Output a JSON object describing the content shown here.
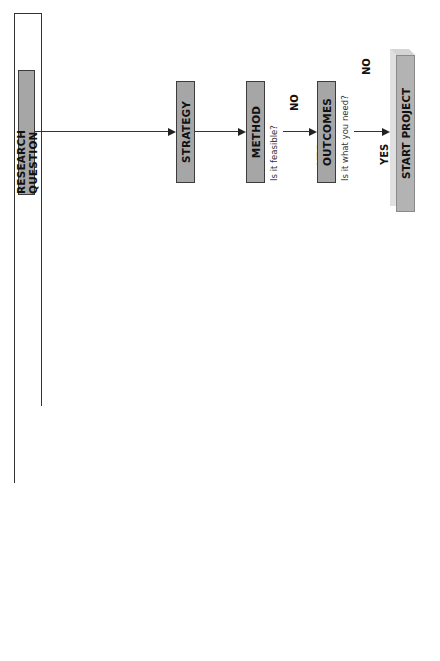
{
  "flow": {
    "research_question": "RESEARCH QUESTION",
    "strategy": "STRATEGY",
    "method": "METHOD",
    "method_question": "Is it feasible?",
    "outcomes": "OUTCOMES",
    "outcomes_question": "Is it what you need?",
    "start_project": "START PROJECT",
    "yes_label": "YES",
    "no_label": "NO"
  },
  "context_panel": {
    "items": [
      "Literature search",
      "Methodology",
      "Research question"
    ]
  },
  "hypothesis": {
    "label": "Hypothesis",
    "branches": [
      "Tested",
      "Generated"
    ]
  },
  "strategy_panel": {
    "experimental": {
      "title": "Experimental",
      "qualifier": "(quantitative)",
      "subtypes": [
        "Interventional",
        "Non-interventional"
      ],
      "designs": [
        "RCT",
        "Quasi-exp",
        "Cohort"
      ]
    },
    "observational": {
      "title": "Observational",
      "qualifier": "(qualitative)",
      "subtypes": [
        "Descriptive"
      ],
      "designs": [
        "Case (controlled)",
        "Survey"
      ]
    }
  },
  "method_panel": {
    "items": [
      "Questionnaire",
      "Interview",
      "Focus group",
      "Diary"
    ]
  },
  "outcome_panel": {
    "steps": [
      "Data",
      "Analysis",
      "Findings"
    ]
  }
}
